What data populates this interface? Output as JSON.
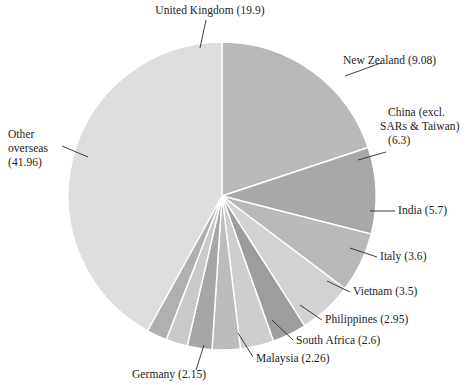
{
  "figure": {
    "title_partial_cropped": "",
    "background": "#ffffff",
    "center": {
      "x": 222,
      "y": 196
    },
    "radius": 154,
    "separator_color": "#ffffff",
    "leader_color": "#2b2b2b"
  },
  "chart_data": {
    "type": "pie",
    "title": "",
    "xlabel": "",
    "ylabel": "",
    "units": "percent",
    "total": 100.0,
    "start_angle_deg": 0,
    "direction": "clockwise",
    "legend": "labels-with-leader-lines",
    "grid": false,
    "categories": [
      "United Kingdom",
      "New Zealand",
      "China (excl. SARs & Taiwan)",
      "India",
      "Italy",
      "Vietnam",
      "Philippines",
      "South Africa",
      "Malaysia",
      "Germany",
      "Other overseas"
    ],
    "values": [
      19.9,
      9.08,
      6.3,
      5.7,
      3.6,
      3.5,
      2.95,
      2.6,
      2.26,
      2.15,
      41.96
    ],
    "colors": [
      "#b9b9b9",
      "#a8a8a8",
      "#b9b9b9",
      "#d2d2d2",
      "#9d9d9d",
      "#cecece",
      "#bcbcbc",
      "#a6a6a6",
      "#cacaca",
      "#b0b0b0",
      "#dedede"
    ],
    "slices": [
      {
        "label": "United Kingdom",
        "value": 19.9,
        "display": "United Kingdom (19.9)",
        "color": "#b9b9b9"
      },
      {
        "label": "New Zealand",
        "value": 9.08,
        "display": "New Zealand (9.08)",
        "color": "#a8a8a8"
      },
      {
        "label": "China (excl. SARs & Taiwan)",
        "value": 6.3,
        "display": "China (excl. SARs & Taiwan) (6.3)",
        "color": "#b9b9b9"
      },
      {
        "label": "India",
        "value": 5.7,
        "display": "India (5.7)",
        "color": "#d2d2d2"
      },
      {
        "label": "Italy",
        "value": 3.6,
        "display": "Italy (3.6)",
        "color": "#9d9d9d"
      },
      {
        "label": "Vietnam",
        "value": 3.5,
        "display": "Vietnam (3.5)",
        "color": "#cecece"
      },
      {
        "label": "Philippines",
        "value": 2.95,
        "display": "Philippines (2.95)",
        "color": "#bcbcbc"
      },
      {
        "label": "South Africa",
        "value": 2.6,
        "display": "South Africa (2.6)",
        "color": "#a6a6a6"
      },
      {
        "label": "Malaysia",
        "value": 2.26,
        "display": "Malaysia (2.26)",
        "color": "#cacaca"
      },
      {
        "label": "Germany",
        "value": 2.15,
        "display": "Germany (2.15)",
        "color": "#b0b0b0"
      },
      {
        "label": "Other overseas",
        "value": 41.96,
        "display": "Other overseas (41.96)",
        "color": "#dedede"
      }
    ]
  },
  "labels": {
    "united_kingdom": "United Kingdom (19.9)",
    "new_zealand": "New Zealand (9.08)",
    "china_line1": "China (excl.",
    "china_line2": "SARs & Taiwan)",
    "china_line3": "(6.3)",
    "india": "India (5.7)",
    "italy": "Italy (3.6)",
    "vietnam": "Vietnam (3.5)",
    "philippines": "Philippines (2.95)",
    "south_africa": "South Africa (2.6)",
    "malaysia": "Malaysia (2.26)",
    "germany": "Germany (2.15)",
    "other_line1": "Other",
    "other_line2": "overseas",
    "other_line3": "(41.96)"
  }
}
